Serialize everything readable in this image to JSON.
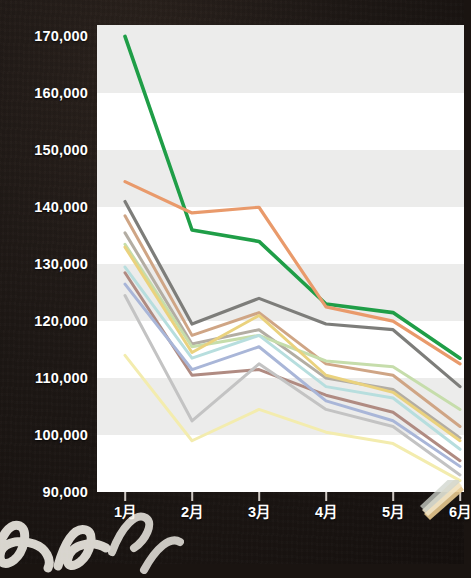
{
  "chart_data": {
    "type": "line",
    "title": "",
    "xlabel": "",
    "ylabel": "",
    "categories": [
      "1月",
      "2月",
      "3月",
      "4月",
      "5月",
      "6月"
    ],
    "x_tick_labels": [
      "1月",
      "2月",
      "3月",
      "4月",
      "5月",
      "6月"
    ],
    "y_tick_labels": [
      "170,000",
      "160,000",
      "150,000",
      "140,000",
      "130,000",
      "120,000",
      "110,000",
      "100,000",
      "90,000"
    ],
    "y_ticks": [
      170000,
      160000,
      150000,
      140000,
      130000,
      120000,
      110000,
      100000,
      90000
    ],
    "ylim": [
      90000,
      172000
    ],
    "grid": "horizontal alternating bands",
    "legend": "none",
    "series": [
      {
        "name": "series-green",
        "color": "#1f9e47",
        "width": 3.6,
        "values": [
          170000,
          136000,
          134000,
          123000,
          121500,
          113500
        ]
      },
      {
        "name": "series-orange",
        "color": "#e99a6b",
        "width": 3.2,
        "values": [
          144500,
          139000,
          140000,
          122500,
          120000,
          112500
        ]
      },
      {
        "name": "series-darkgray",
        "color": "#7d7d7a",
        "width": 3.2,
        "values": [
          141000,
          119500,
          124000,
          119500,
          118500,
          108500
        ]
      },
      {
        "name": "series-tan",
        "color": "#cfa585",
        "width": 3.0,
        "values": [
          138500,
          117500,
          121500,
          112500,
          110500,
          101500
        ]
      },
      {
        "name": "series-warmgray",
        "color": "#b3ada3",
        "width": 3.0,
        "values": [
          135500,
          116000,
          118500,
          110000,
          108000,
          99500
        ]
      },
      {
        "name": "series-palegreen",
        "color": "#c6ddab",
        "width": 3.0,
        "values": [
          133500,
          115500,
          117500,
          113000,
          112000,
          104500
        ]
      },
      {
        "name": "series-yellow",
        "color": "#ead27e",
        "width": 3.0,
        "values": [
          133000,
          114500,
          121000,
          110500,
          107500,
          99000
        ]
      },
      {
        "name": "series-cyan",
        "color": "#b7dede",
        "width": 3.0,
        "values": [
          129500,
          113500,
          117500,
          108500,
          106500,
          97500
        ]
      },
      {
        "name": "series-mauve",
        "color": "#b08b82",
        "width": 3.0,
        "values": [
          128500,
          110500,
          111500,
          107000,
          104000,
          95500
        ]
      },
      {
        "name": "series-blue",
        "color": "#a9b6d8",
        "width": 3.0,
        "values": [
          126500,
          111500,
          115500,
          106000,
          102500,
          94500
        ]
      },
      {
        "name": "series-lightgray",
        "color": "#c3c3c3",
        "width": 3.0,
        "values": [
          124500,
          102500,
          112500,
          104500,
          101500,
          93000
        ]
      },
      {
        "name": "series-paleyellow",
        "color": "#f3ecae",
        "width": 3.0,
        "values": [
          114000,
          99000,
          104500,
          100500,
          98500,
          92000
        ]
      }
    ]
  },
  "axes": {
    "y_axis_name": "value-axis",
    "x_axis_name": "month-axis"
  }
}
